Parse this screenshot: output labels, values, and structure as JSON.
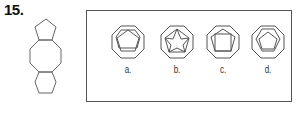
{
  "question": {
    "number": "15."
  },
  "stem_figure": {
    "shapes": [
      "pentagon",
      "octagon",
      "hexagon"
    ],
    "description": "Pentagon stacked on octagon stacked on hexagon"
  },
  "options": [
    {
      "label": "a.",
      "inner_shape": "pentagon",
      "outer_shape": "octagon"
    },
    {
      "label": "b.",
      "inner_shape": "pentagon-with-star",
      "outer_shape": "octagon"
    },
    {
      "label": "c.",
      "inner_shape": "pentagon-with-square",
      "outer_shape": "octagon"
    },
    {
      "label": "d.",
      "inner_shape": "pentagon-in-hexagon",
      "outer_shape": "octagon"
    }
  ],
  "colors": {
    "line": "#555555",
    "text": "#111111"
  }
}
